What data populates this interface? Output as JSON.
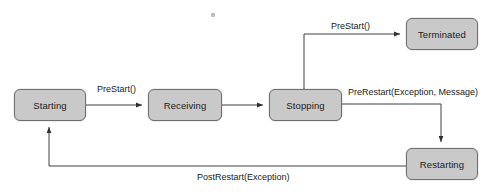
{
  "diagram": {
    "background_color": "#ffffff",
    "node_fill_color": "#c9c9c9",
    "node_border_color": "#6e6e6e",
    "edge_color": "#404040",
    "text_color": "#1a1a1a",
    "states": [
      {
        "id": "starting",
        "label": "Starting",
        "x": 14,
        "y": 89,
        "w": 72,
        "h": 32
      },
      {
        "id": "receiving",
        "label": "Receiving",
        "x": 148,
        "y": 89,
        "w": 74,
        "h": 32
      },
      {
        "id": "stopping",
        "label": "Stopping",
        "x": 269,
        "y": 89,
        "w": 73,
        "h": 32
      },
      {
        "id": "terminated",
        "label": "Terminated",
        "x": 406,
        "y": 18,
        "w": 72,
        "h": 32
      },
      {
        "id": "restarting",
        "label": "Restarting",
        "x": 406,
        "y": 148,
        "w": 72,
        "h": 32
      }
    ],
    "transitions": [
      {
        "id": "starting-to-receiving",
        "from": "starting",
        "to": "receiving",
        "label": "PreStart()"
      },
      {
        "id": "receiving-to-stopping",
        "from": "receiving",
        "to": "stopping",
        "label": ""
      },
      {
        "id": "stopping-to-terminated",
        "from": "stopping",
        "to": "terminated",
        "label": "PreStart()"
      },
      {
        "id": "stopping-to-restarting",
        "from": "stopping",
        "to": "restarting",
        "label": "PreRestart(Exception, Message)"
      },
      {
        "id": "restarting-to-starting",
        "from": "restarting",
        "to": "starting",
        "label": "PostRestart(Exception)"
      }
    ],
    "edge_labels": {
      "prestart_starting": "PreStart()",
      "prestart_terminated": "PreStart()",
      "prerestart": "PreRestart(Exception, Message)",
      "postrestart": "PostRestart(Exception)"
    }
  }
}
